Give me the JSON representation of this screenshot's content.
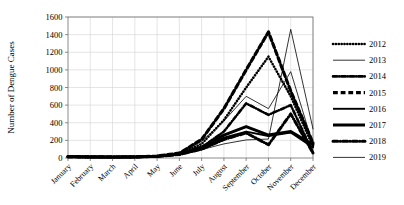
{
  "chart_data": {
    "type": "line",
    "title": "",
    "xlabel": "",
    "ylabel": "Number of Dengue Cases",
    "ylim": [
      0,
      1600
    ],
    "ytick_step": 200,
    "yticks": [
      0,
      200,
      400,
      600,
      800,
      1000,
      1200,
      1400,
      1600
    ],
    "grid": true,
    "legend_position": "right",
    "categories": [
      "January",
      "February",
      "March",
      "April",
      "May",
      "June",
      "July",
      "August",
      "September",
      "October",
      "November",
      "December"
    ],
    "series": [
      {
        "name": "2012",
        "style": "dotted",
        "width": 2.6,
        "values": [
          15,
          12,
          10,
          12,
          20,
          45,
          160,
          430,
          800,
          1150,
          700,
          130
        ]
      },
      {
        "name": "2013",
        "style": "solid",
        "width": 0.8,
        "values": [
          12,
          10,
          9,
          10,
          16,
          40,
          190,
          420,
          700,
          560,
          980,
          150
        ]
      },
      {
        "name": "2014",
        "style": "dash-dot",
        "width": 2.6,
        "values": [
          14,
          11,
          10,
          11,
          18,
          42,
          120,
          300,
          620,
          490,
          600,
          60
        ]
      },
      {
        "name": "2015",
        "style": "dashed",
        "width": 3.2,
        "values": [
          16,
          13,
          11,
          13,
          22,
          55,
          210,
          560,
          1000,
          1430,
          760,
          170
        ]
      },
      {
        "name": "2016",
        "style": "solid",
        "width": 1.9,
        "values": [
          13,
          11,
          10,
          11,
          17,
          38,
          110,
          230,
          300,
          250,
          290,
          120
        ]
      },
      {
        "name": "2017",
        "style": "solid",
        "width": 3.0,
        "values": [
          15,
          12,
          11,
          12,
          19,
          44,
          125,
          260,
          355,
          260,
          300,
          150
        ]
      },
      {
        "name": "2018",
        "style": "dash-dot",
        "width": 3.0,
        "values": [
          14,
          12,
          10,
          12,
          18,
          40,
          100,
          210,
          285,
          150,
          500,
          55
        ]
      },
      {
        "name": "2019",
        "style": "solid",
        "width": 0.8,
        "values": [
          11,
          9,
          8,
          10,
          15,
          35,
          95,
          160,
          205,
          215,
          1460,
          330
        ]
      }
    ]
  },
  "legend": {
    "entries": [
      {
        "label": "2012"
      },
      {
        "label": "2013"
      },
      {
        "label": "2014"
      },
      {
        "label": "2015"
      },
      {
        "label": "2016"
      },
      {
        "label": "2017"
      },
      {
        "label": "2018"
      },
      {
        "label": "2019"
      }
    ]
  }
}
